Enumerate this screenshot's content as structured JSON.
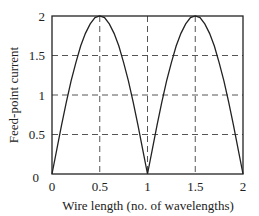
{
  "chart_data": {
    "type": "line",
    "title": "",
    "xlabel": "Wire length (no. of wavelengths)",
    "ylabel": "Feed-point current",
    "xlim": [
      0,
      2
    ],
    "ylim": [
      0,
      2
    ],
    "x_ticks": [
      "0",
      "0.5",
      "1",
      "1.5",
      "2"
    ],
    "y_ticks": [
      "0",
      "0.5",
      "1",
      "1.5",
      "2"
    ],
    "grid": "dashed, at 0.5 intervals",
    "legend": null,
    "series": [
      {
        "name": "Feed-point current",
        "x": [
          0,
          0.05,
          0.1,
          0.15,
          0.2,
          0.25,
          0.3,
          0.35,
          0.4,
          0.45,
          0.5,
          0.55,
          0.6,
          0.65,
          0.7,
          0.75,
          0.8,
          0.85,
          0.9,
          0.95,
          1.0,
          1.05,
          1.1,
          1.15,
          1.2,
          1.25,
          1.3,
          1.35,
          1.4,
          1.45,
          1.5,
          1.55,
          1.6,
          1.65,
          1.7,
          1.75,
          1.8,
          1.85,
          1.9,
          1.95,
          2.0
        ],
        "values": [
          0,
          0.31,
          0.62,
          0.91,
          1.18,
          1.41,
          1.62,
          1.78,
          1.9,
          1.98,
          2.0,
          1.98,
          1.9,
          1.78,
          1.62,
          1.41,
          1.18,
          0.91,
          0.62,
          0.31,
          0,
          0.31,
          0.62,
          0.91,
          1.18,
          1.41,
          1.62,
          1.78,
          1.9,
          1.98,
          2.0,
          1.98,
          1.9,
          1.78,
          1.62,
          1.41,
          1.18,
          0.91,
          0.62,
          0.31,
          0
        ]
      }
    ]
  },
  "labels": {
    "xlabel": "Wire length (no. of wavelengths)",
    "ylabel": "Feed-point current",
    "x_ticks": [
      "0",
      "0.5",
      "1",
      "1.5",
      "2"
    ],
    "y_ticks": [
      "0",
      "0.5",
      "1",
      "1.5",
      "2"
    ]
  }
}
